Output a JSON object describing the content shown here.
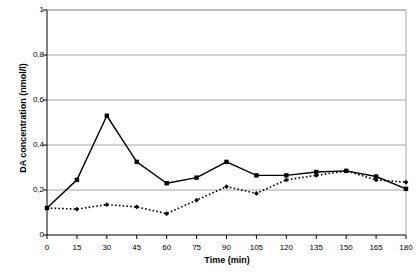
{
  "chart_data": {
    "type": "line",
    "title": "",
    "xlabel": "Time (min)",
    "ylabel": "DA concentration (nmol/l)",
    "x": [
      0,
      15,
      30,
      45,
      60,
      75,
      90,
      105,
      120,
      135,
      150,
      165,
      180
    ],
    "xtick_labels": [
      "0",
      "15",
      "30",
      "45",
      "60",
      "75",
      "90",
      "105",
      "120",
      "135",
      "150",
      "165",
      "180"
    ],
    "ytick_labels": [
      "0",
      "0,2",
      "0,4",
      "0,6",
      "0,8",
      "1"
    ],
    "ytick_values": [
      0,
      0.2,
      0.4,
      0.6,
      0.8,
      1
    ],
    "xlim": [
      0,
      180
    ],
    "ylim": [
      0,
      1
    ],
    "grid": "horizontal",
    "legend": "none",
    "series": [
      {
        "name": "solid-series",
        "line_style": "solid",
        "marker": "square",
        "color": "#000000",
        "values": [
          0.12,
          0.245,
          0.53,
          0.325,
          0.23,
          0.255,
          0.325,
          0.265,
          0.265,
          0.28,
          0.285,
          0.26,
          0.205
        ]
      },
      {
        "name": "dotted-series",
        "line_style": "dotted",
        "marker": "diamond",
        "color": "#000000",
        "values": [
          0.12,
          0.115,
          0.135,
          0.125,
          0.095,
          0.155,
          0.215,
          0.185,
          0.245,
          0.265,
          0.285,
          0.245,
          0.235
        ]
      }
    ]
  },
  "colors": {
    "axis": "#000000",
    "grid": "#a6a6a6",
    "background": "#ffffff"
  }
}
